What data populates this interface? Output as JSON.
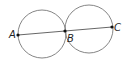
{
  "diagram": {
    "type": "geometry",
    "circles": [
      {
        "cx": 42,
        "cy": 34,
        "r": 24
      },
      {
        "cx": 89,
        "cy": 29,
        "r": 24
      }
    ],
    "segment": {
      "from": "A",
      "to": "C",
      "through": "B"
    },
    "points": [
      {
        "label": "A",
        "x": 18,
        "y": 35
      },
      {
        "label": "B",
        "x": 65,
        "y": 31
      },
      {
        "label": "C",
        "x": 112,
        "y": 27
      }
    ],
    "colors": {
      "stroke": "#666666",
      "point": "#111111",
      "text": "#222222"
    }
  }
}
